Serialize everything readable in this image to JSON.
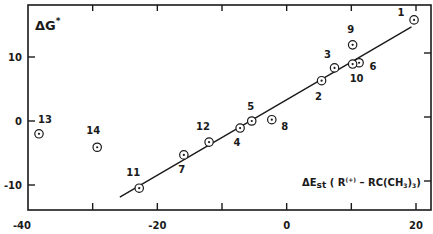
{
  "chart_data": {
    "type": "scatter",
    "title": "",
    "xlabel": "ΔE_st (R(+) − RC(CH3)3)",
    "ylabel": "ΔG*",
    "xlim": [
      -40,
      22
    ],
    "ylim": [
      -13,
      18
    ],
    "x_ticks": [
      -40,
      -30,
      -20,
      -10,
      0,
      10,
      20
    ],
    "x_tick_labels": [
      "-40",
      "",
      "-20",
      "",
      "0",
      "",
      "20"
    ],
    "y_ticks": [
      -10,
      0,
      10
    ],
    "y_tick_labels": [
      "-10",
      "0",
      "10"
    ],
    "grid": false,
    "legend": null,
    "series": [
      {
        "name": "compounds",
        "marker": "circled-dot",
        "points": [
          {
            "label": "1",
            "x": 19.7,
            "y": 15.8
          },
          {
            "label": "2",
            "x": 5.4,
            "y": 6.3
          },
          {
            "label": "3",
            "x": 7.4,
            "y": 8.3
          },
          {
            "label": "4",
            "x": -7.2,
            "y": -1.1
          },
          {
            "label": "5",
            "x": -5.4,
            "y": 0.0
          },
          {
            "label": "6",
            "x": 11.2,
            "y": 9.1
          },
          {
            "label": "7",
            "x": -15.9,
            "y": -5.3
          },
          {
            "label": "8",
            "x": -2.3,
            "y": 0.2
          },
          {
            "label": "9",
            "x": 10.2,
            "y": 11.9
          },
          {
            "label": "10",
            "x": 10.2,
            "y": 8.9
          },
          {
            "label": "11",
            "x": -22.8,
            "y": -10.5
          },
          {
            "label": "12",
            "x": -12.0,
            "y": -3.3
          },
          {
            "label": "13",
            "x": -38.3,
            "y": -2.0
          },
          {
            "label": "14",
            "x": -29.3,
            "y": -4.1
          }
        ]
      }
    ],
    "fit_line": {
      "x1": -25.8,
      "y1": -11.9,
      "x2": 19.3,
      "y2": 14.7
    }
  },
  "labels": {
    "y_axis": "ΔG",
    "y_axis_sup": "*",
    "x_axis_main": "ΔE",
    "x_axis_sub": "st",
    "x_axis_rest_1": " ( R",
    "x_axis_sup": "(+)",
    "x_axis_rest_2": " – RC(CH",
    "x_axis_sub2": "3",
    "x_axis_rest_3": ")",
    "x_axis_sub3": "3",
    "x_axis_rest_4": ")"
  }
}
